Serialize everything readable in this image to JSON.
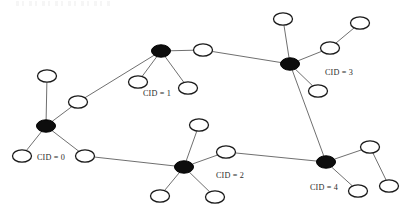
{
  "figure": {
    "title": "",
    "background_color": "#ffffff",
    "width": 409,
    "height": 212
  },
  "chart_data": {
    "type": "diagram",
    "diagram_type": "node-link-network-graph",
    "title": "",
    "legend": [],
    "colors": {
      "hub_fill": "#0d0d0d",
      "leaf_fill": "#ffffff",
      "node_stroke": "#1a1a1a",
      "edge_stroke": "#4a4a4a",
      "label_color": "#2b2b2b",
      "background": "#ffffff"
    },
    "node_shape": "ellipse",
    "leaf_radius": {
      "rx": 9.5,
      "ry": 6.2
    },
    "hub_radius": {
      "rx": 9.5,
      "ry": 6.2
    },
    "nodes": [
      {
        "id": "h0",
        "type": "hub",
        "cluster": 0,
        "x": 46,
        "y": 126
      },
      {
        "id": "n0a",
        "type": "leaf",
        "cluster": 0,
        "x": 47,
        "y": 76
      },
      {
        "id": "n0b",
        "type": "leaf",
        "cluster": 0,
        "x": 78,
        "y": 102
      },
      {
        "id": "n0c",
        "type": "leaf",
        "cluster": 0,
        "x": 22,
        "y": 156
      },
      {
        "id": "n0d",
        "type": "leaf",
        "cluster": 0,
        "x": 85,
        "y": 156
      },
      {
        "id": "h1",
        "type": "hub",
        "cluster": 1,
        "x": 161,
        "y": 51
      },
      {
        "id": "n1a",
        "type": "leaf",
        "cluster": 1,
        "x": 138,
        "y": 82
      },
      {
        "id": "n1b",
        "type": "leaf",
        "cluster": 1,
        "x": 188,
        "y": 88
      },
      {
        "id": "n1c",
        "type": "leaf",
        "cluster": 1,
        "x": 203,
        "y": 50
      },
      {
        "id": "h2",
        "type": "hub",
        "cluster": 2,
        "x": 184,
        "y": 167
      },
      {
        "id": "n2a",
        "type": "leaf",
        "cluster": 2,
        "x": 199,
        "y": 125
      },
      {
        "id": "n2b",
        "type": "leaf",
        "cluster": 2,
        "x": 226,
        "y": 152
      },
      {
        "id": "n2c",
        "type": "leaf",
        "cluster": 2,
        "x": 160,
        "y": 196
      },
      {
        "id": "n2d",
        "type": "leaf",
        "cluster": 2,
        "x": 215,
        "y": 197
      },
      {
        "id": "h3",
        "type": "hub",
        "cluster": 3,
        "x": 290,
        "y": 64
      },
      {
        "id": "n3a",
        "type": "leaf",
        "cluster": 3,
        "x": 283,
        "y": 19
      },
      {
        "id": "n3b",
        "type": "leaf",
        "cluster": 3,
        "x": 330,
        "y": 48
      },
      {
        "id": "n3c",
        "type": "leaf",
        "cluster": 3,
        "x": 360,
        "y": 23
      },
      {
        "id": "n3d",
        "type": "leaf",
        "cluster": 3,
        "x": 318,
        "y": 91
      },
      {
        "id": "h4",
        "type": "hub",
        "cluster": 4,
        "x": 326,
        "y": 162
      },
      {
        "id": "n4a",
        "type": "leaf",
        "cluster": 4,
        "x": 370,
        "y": 147
      },
      {
        "id": "n4b",
        "type": "leaf",
        "cluster": 4,
        "x": 389,
        "y": 186
      },
      {
        "id": "n4c",
        "type": "leaf",
        "cluster": 4,
        "x": 358,
        "y": 191
      }
    ],
    "edges": [
      {
        "from": "h0",
        "to": "n0a"
      },
      {
        "from": "h0",
        "to": "n0b"
      },
      {
        "from": "h0",
        "to": "n0c"
      },
      {
        "from": "h0",
        "to": "n0d"
      },
      {
        "from": "n0b",
        "to": "h1"
      },
      {
        "from": "h1",
        "to": "n1a"
      },
      {
        "from": "h1",
        "to": "n1b"
      },
      {
        "from": "h1",
        "to": "n1c"
      },
      {
        "from": "n1c",
        "to": "h3"
      },
      {
        "from": "h3",
        "to": "n3a"
      },
      {
        "from": "h3",
        "to": "n3b"
      },
      {
        "from": "n3b",
        "to": "n3c"
      },
      {
        "from": "h3",
        "to": "n3d"
      },
      {
        "from": "h3",
        "to": "h4"
      },
      {
        "from": "n0d",
        "to": "h2"
      },
      {
        "from": "h2",
        "to": "n2a"
      },
      {
        "from": "h2",
        "to": "n2b"
      },
      {
        "from": "h2",
        "to": "n2c"
      },
      {
        "from": "h2",
        "to": "n2d"
      },
      {
        "from": "n2b",
        "to": "h4"
      },
      {
        "from": "h4",
        "to": "n4a"
      },
      {
        "from": "n4a",
        "to": "n4b"
      },
      {
        "from": "h4",
        "to": "n4c"
      }
    ],
    "labels": [
      {
        "id": "lbl0",
        "text": "CID = 0",
        "x": 37,
        "y": 158,
        "anchor": "start"
      },
      {
        "id": "lbl1",
        "text": "CID = 1",
        "x": 143,
        "y": 94,
        "anchor": "start"
      },
      {
        "id": "lbl2",
        "text": "CID = 2",
        "x": 216,
        "y": 176,
        "anchor": "start"
      },
      {
        "id": "lbl3",
        "text": "CID = 3",
        "x": 325,
        "y": 73,
        "anchor": "start"
      },
      {
        "id": "lbl4",
        "text": "CID = 4",
        "x": 310,
        "y": 188,
        "anchor": "start"
      }
    ],
    "cluster_count": 5,
    "node_count": 23,
    "edge_count": 23
  }
}
